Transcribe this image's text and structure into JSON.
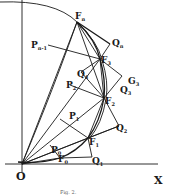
{
  "figure": {
    "caption": "Fig. 2.",
    "axes": {
      "origin_label": "O",
      "x_label": "X"
    },
    "labels": {
      "Fn": {
        "main": "F",
        "sub": "n"
      },
      "Qn": {
        "main": "Q",
        "sub": "n"
      },
      "Pn1": {
        "main": "P",
        "sub": "n-1"
      },
      "F3": {
        "main": "F",
        "sub": "3"
      },
      "G3": {
        "main": "G",
        "sub": "3"
      },
      "Q4": {
        "main": "Q",
        "sub": "4"
      },
      "Q3": {
        "main": "Q",
        "sub": "3"
      },
      "P2": {
        "main": "P",
        "sub": "2"
      },
      "F2": {
        "main": "F",
        "sub": "2"
      },
      "P1": {
        "main": "P",
        "sub": "1"
      },
      "Q2": {
        "main": "Q",
        "sub": "2"
      },
      "F1": {
        "main": "F",
        "sub": "1"
      },
      "P0": {
        "main": "P",
        "sub": "0"
      },
      "Q1": {
        "main": "Q",
        "sub": "1"
      },
      "F0": {
        "main": "F",
        "sub": "0"
      }
    },
    "colors": {
      "ink": "#1a1a1a",
      "background": "#ffffff"
    }
  }
}
